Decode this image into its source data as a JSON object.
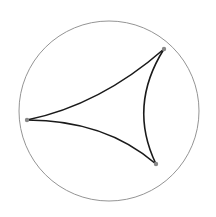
{
  "diagram": {
    "type": "hyperbolic-ideal-triangle",
    "canvas": {
      "width": 216,
      "height": 217,
      "background": "#ffffff"
    },
    "boundary_circle": {
      "cx": 109,
      "cy": 111,
      "r": 90,
      "stroke": "#888888",
      "stroke_width": 0.9
    },
    "vertices": [
      {
        "name": "top-right",
        "x": 164,
        "y": 49
      },
      {
        "name": "left",
        "x": 27,
        "y": 120
      },
      {
        "name": "bottom-right",
        "x": 156,
        "y": 164
      }
    ],
    "vertex_color": "#888888",
    "vertex_radius": 2.2,
    "edges": [
      {
        "name": "left-to-top",
        "d": "M27,120 Q100,105 164,49"
      },
      {
        "name": "left-to-bottom",
        "d": "M27,120 Q105,120 156,164"
      },
      {
        "name": "top-to-bottom",
        "d": "M164,49 Q128,106 156,164"
      }
    ],
    "edge_color": "#1a1a1a",
    "edge_width": 1.6
  }
}
